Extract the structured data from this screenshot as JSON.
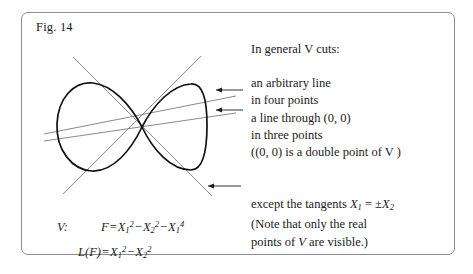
{
  "figure": {
    "label": "Fig. 14",
    "border_color": "#8d8d8d",
    "ink_color": "#1a1a1a",
    "line_color": "#6b6b6b"
  },
  "annotations": {
    "general_heading": "In general V cuts:",
    "arbitrary_line_1": "an arbitrary line",
    "arbitrary_line_2": "in four points",
    "through_origin_1": "a line through (0, 0)",
    "through_origin_2": "in three points",
    "through_origin_3": "((0, 0) is a double point of V )",
    "except_line_1_prefix": "except the tangents ",
    "except_line_1_var": "X",
    "except_line_1_sub": "1",
    "except_line_1_eq": " = ±",
    "except_line_1_var2": "X",
    "except_line_1_sub2": "2",
    "except_line_2": "(Note that only the real",
    "except_line_3_a": "points of ",
    "except_line_3_v": "V",
    "except_line_3_b": " are visible.)"
  },
  "equations": {
    "v_label": "V:",
    "f_lhs": "F",
    "f_eq": "=",
    "f_term1_var": "X",
    "f_term1_sub": "1",
    "f_term1_sup": "2",
    "f_minus1": "−",
    "f_term2_var": "X",
    "f_term2_sub": "2",
    "f_term2_sup": "2",
    "f_minus2": "−",
    "f_term3_var": "X",
    "f_term3_sub": "1",
    "f_term3_sup": "4",
    "l_lhs_l": "L",
    "l_lhs_open": "(",
    "l_lhs_f": "F",
    "l_lhs_close": ")",
    "l_eq": "=",
    "l_term1_var": "X",
    "l_term1_sub": "1",
    "l_term1_sup": "2",
    "l_minus": "−",
    "l_term2_var": "X",
    "l_term2_sub": "2",
    "l_term2_sup": "2"
  },
  "geometry": {
    "node_x": 142,
    "node_y": 127,
    "left_lobe_extent_x": 57,
    "right_lobe_extent_x": 207,
    "curve_top_y": 83,
    "curve_bottom_y": 172
  }
}
